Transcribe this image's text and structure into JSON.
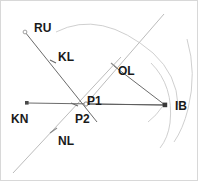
{
  "diagram": {
    "background_color": "#ffffff",
    "border_color": "#d8d8d8",
    "stroke_dark": "#555555",
    "stroke_light": "#bcbcbc",
    "stroke_arc": "#cccccc",
    "label_color": "#1a1a1a",
    "labels": {
      "ru": "RU",
      "kl": "KL",
      "ol": "OL",
      "p1": "P1",
      "p2": "P2",
      "ib": "IB",
      "kn": "KN",
      "nl": "NL"
    },
    "points": [
      {
        "name": "RU",
        "x": 24,
        "y": 31,
        "marker": "circle-open"
      },
      {
        "name": "KL",
        "x": 52,
        "y": 60,
        "marker": "tick"
      },
      {
        "name": "OL",
        "x": 113,
        "y": 64,
        "marker": "tick"
      },
      {
        "name": "P1",
        "x": 85,
        "y": 103,
        "marker": "circle-open"
      },
      {
        "name": "P2",
        "x": 73,
        "y": 104,
        "marker": "tick"
      },
      {
        "name": "IB",
        "x": 164,
        "y": 104,
        "marker": "square-filled"
      },
      {
        "name": "KN",
        "x": 26,
        "y": 102,
        "marker": "square-filled"
      },
      {
        "name": "NL",
        "x": 52,
        "y": 130,
        "marker": "tick"
      }
    ],
    "segments": [
      {
        "name": "ru-to-p2-line",
        "x1": 24,
        "y1": 31,
        "x2": 95,
        "y2": 120,
        "shade": "dark"
      },
      {
        "name": "kn-to-ib-line",
        "x1": 26,
        "y1": 102,
        "x2": 164,
        "y2": 104,
        "shade": "dark"
      },
      {
        "name": "ol-to-ib-line",
        "x1": 85,
        "y1": 103,
        "x2": 164,
        "y2": 104,
        "shade": "dark"
      },
      {
        "name": "p1-to-ol-ray",
        "x1": 85,
        "y1": 103,
        "x2": 163,
        "y2": 13,
        "shade": "light"
      },
      {
        "name": "nl-diagonal-line",
        "x1": 12,
        "y1": 172,
        "x2": 120,
        "y2": 56,
        "shade": "light"
      }
    ],
    "arcs": [
      {
        "name": "outer-arc-large",
        "d": "M 55 31 Q 100 8 152 52 Q 176 74 176 104",
        "shade": "arc"
      },
      {
        "name": "inner-arc-near-ib",
        "d": "M 185 38 Q 196 72 186 108 Q 181 128 172 140",
        "shade": "arc"
      },
      {
        "name": "short-arc-through-ib",
        "d": "M 150 62 Q 172 84 168 122 Q 166 136 158 146",
        "shade": "arc"
      },
      {
        "name": "small-arc-left-of-ib",
        "d": "M 148 119 Q 156 113 160 106",
        "shade": "arc"
      }
    ]
  }
}
